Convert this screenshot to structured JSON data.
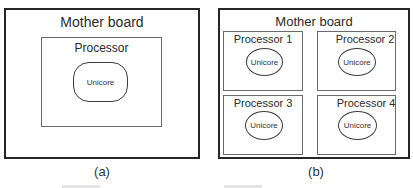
{
  "figure_a": {
    "motherboard_label": "Mother board",
    "processor_label": "Processor",
    "core_label": "Unicore",
    "caption": "(a)"
  },
  "figure_b": {
    "motherboard_label": "Mother board",
    "processors": [
      {
        "label": "Processor 1",
        "core_label": "Unicore"
      },
      {
        "label": "Processor 2",
        "core_label": "Unicore"
      },
      {
        "label": "Processor 3",
        "core_label": "Unicore"
      },
      {
        "label": "Processor 4",
        "core_label": "Unicore"
      }
    ],
    "caption": "(b)"
  },
  "colors": {
    "board_border": "#262626",
    "processor_border": "#6a6a6a",
    "core_border": "#3c3c3c"
  }
}
